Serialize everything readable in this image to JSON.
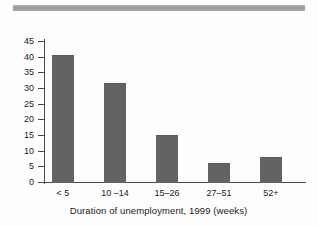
{
  "chart_data": {
    "type": "bar",
    "title": "",
    "subtitle": "",
    "xlabel": "Duration of unemployment, 1999 (weeks)",
    "ylabel": "",
    "categories": [
      "< 5",
      "10 –14",
      "15–26",
      "27–51",
      "52+"
    ],
    "values": [
      40.5,
      31.5,
      14.9,
      6.2,
      8.1
    ],
    "ylim": [
      0,
      45
    ],
    "yticks": [
      0,
      5,
      10,
      15,
      20,
      25,
      30,
      35,
      40,
      45
    ],
    "ytick_labels": [
      "0",
      "5",
      "10",
      "15",
      "20",
      "25",
      "30",
      "35",
      "40",
      "45"
    ],
    "grid": false,
    "legend": null,
    "bar_color": "#636363",
    "axis_color": "#4a4a4a",
    "background_color": "#fdfdfd"
  },
  "decoration": {
    "top_rule_color": "#9a9a9a"
  }
}
